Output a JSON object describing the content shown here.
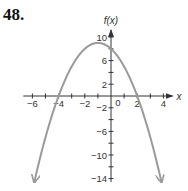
{
  "problem_number": "48.",
  "chart_data": {
    "type": "line",
    "title": "",
    "function": "f(x) = -x^2 - 2x + 8",
    "xlabel": "x",
    "ylabel": "f(x)",
    "xlim": [
      -6.5,
      4.5
    ],
    "ylim": [
      -14.5,
      11
    ],
    "x_ticks": [
      -6,
      -5,
      -4,
      -3,
      -2,
      -1,
      0,
      1,
      2,
      3,
      4
    ],
    "x_tick_labels": [
      "-6",
      "-4",
      "-2",
      "0",
      "2",
      "4"
    ],
    "y_ticks": [
      10,
      8,
      6,
      4,
      2,
      -2,
      -4,
      -6,
      -8,
      -10,
      -12,
      -14
    ],
    "y_tick_labels": [
      "10",
      "6",
      "2",
      "-2",
      "-6",
      "-10",
      "-14"
    ],
    "grid": false,
    "features": {
      "vertex": [
        -1,
        9
      ],
      "x_intercepts": [
        -4,
        2
      ],
      "y_intercept": 8,
      "opens": "down",
      "end_arrows": true
    },
    "series": [
      {
        "name": "f(x)",
        "x": [
          -5.86,
          -5,
          -4,
          -3,
          -2,
          -1,
          0,
          1,
          2,
          3,
          3.86
        ],
        "values": [
          -14.6,
          -7,
          0,
          5,
          8,
          9,
          8,
          5,
          0,
          -7,
          -14.6
        ]
      }
    ],
    "colors": {
      "curve": "#9a9a9a",
      "axes": "#333333"
    }
  }
}
